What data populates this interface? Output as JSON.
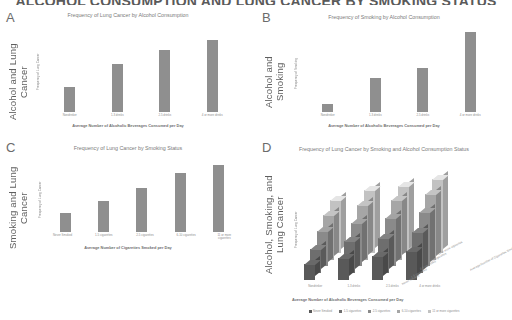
{
  "main_title": "ALCOHOL CONSUMPTION AND LUNG CANCER BY SMOKING STATUS",
  "panels": {
    "a": {
      "letter": "A",
      "side_label": "Alcohol and Lung Cancer",
      "title": "Frequency of Lung Cancer by Alcohol Consumption",
      "ylabel": "Frequency of Lung Cancer",
      "xlabel": "Average Number of Alcoholic Beverages Consumed per Day"
    },
    "b": {
      "letter": "B",
      "side_label": "Alcohol and Smoking",
      "title": "Frequency of Smoking by Alcohol Consumption",
      "ylabel": "Frequency of Smoking",
      "xlabel": "Average Number of Alcoholic Beverages Consumed per Day"
    },
    "c": {
      "letter": "C",
      "side_label": "Smoking and Lung Cancer",
      "title": "Frequency of Lung Cancer by Smoking Status",
      "ylabel": "Frequency of Lung Cancer",
      "xlabel": "Average Number of Cigarettes Smoked per Day"
    },
    "d": {
      "letter": "D",
      "side_label": "Alcohol, Smoking, and Lung Cancer",
      "title": "Frequency of Lung Cancer by Smoking and Alcohol Consumption Status",
      "ylabel": "Frequency of Lung Cancer",
      "xlabel": "Average Number of Alcoholic Beverages Consumed per Day",
      "zlabel": "Average Number of Cigarettes Smoked per Day"
    }
  },
  "colors": {
    "bar": "#8f8f8f",
    "text": "#7a7a7a",
    "title": "#5a5a5a",
    "series": [
      "#595959",
      "#6e6e6e",
      "#8a8a8a",
      "#a6a6a6",
      "#c2c2c2"
    ]
  },
  "chart_data": [
    {
      "id": "a",
      "type": "bar",
      "title": "Frequency of Lung Cancer by Alcohol Consumption",
      "xlabel": "Average Number of Alcoholic Beverages Consumed per Day",
      "ylabel": "Frequency of Lung Cancer",
      "categories": [
        "Nondrinker",
        "1-3 drinks",
        "2-5 drinks",
        "4 or more drinks"
      ],
      "values": [
        30,
        58,
        76,
        88
      ],
      "ylim": [
        0,
        100
      ],
      "grid": false,
      "legend": "none"
    },
    {
      "id": "b",
      "type": "bar",
      "title": "Frequency of Smoking by Alcohol Consumption",
      "xlabel": "Average Number of Alcoholic Beverages Consumed per Day",
      "ylabel": "Frequency of Smoking",
      "categories": [
        "Nondrinker",
        "1-3 drinks",
        "2-5 drinks",
        "4 or more drinks"
      ],
      "values": [
        10,
        40,
        52,
        95
      ],
      "ylim": [
        0,
        100
      ],
      "grid": false,
      "legend": "none"
    },
    {
      "id": "c",
      "type": "bar",
      "title": "Frequency of Lung Cancer by Smoking Status",
      "xlabel": "Average Number of Cigarettes Smoked per Day",
      "ylabel": "Frequency of Lung Cancer",
      "categories": [
        "Never Smoked",
        "1-5 cigarettes",
        "2-5 cigarettes",
        "6-10 cigarettes",
        "11 or more cigarettes"
      ],
      "values": [
        26,
        42,
        60,
        80,
        90
      ],
      "ylim": [
        0,
        100
      ],
      "grid": false,
      "legend": "none"
    },
    {
      "id": "d",
      "type": "bar",
      "title": "Frequency of Lung Cancer by Smoking and Alcohol Consumption Status",
      "xlabel": "Average Number of Alcoholic Beverages Consumed per Day",
      "ylabel": "Frequency of Lung Cancer",
      "zlabel": "Average Number of Cigarettes Smoked per Day",
      "categories": [
        "Nondrinker",
        "1-3 drinks",
        "2-5 drinks",
        "4 or more drinks"
      ],
      "series": [
        {
          "name": "Never Smoked",
          "values": [
            20,
            28,
            30,
            36
          ]
        },
        {
          "name": "1-5 cigarettes",
          "values": [
            30,
            40,
            44,
            52
          ]
        },
        {
          "name": "2-5 cigarettes",
          "values": [
            44,
            54,
            60,
            68
          ]
        },
        {
          "name": "6-10 cigarettes",
          "values": [
            56,
            68,
            74,
            82
          ]
        },
        {
          "name": "11 or more cigarettes",
          "values": [
            66,
            78,
            84,
            92
          ]
        }
      ],
      "ylim": [
        0,
        100
      ],
      "grid": false,
      "legend": "bottom"
    }
  ]
}
